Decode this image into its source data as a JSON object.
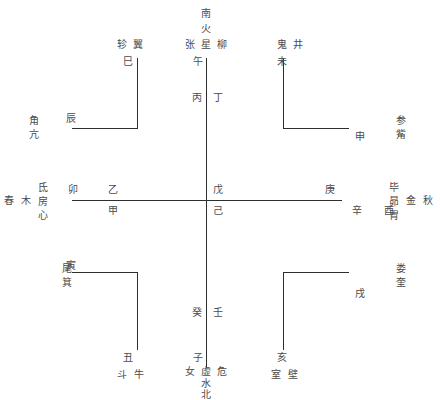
{
  "diagram": {
    "type": "cosmological-cross-chart",
    "line_color": "#2e2e2e",
    "text_color": "#4a4a4a",
    "background": "#ffffff",
    "directions": {
      "south": "南",
      "north": "北",
      "east_season": "春",
      "west_season": "秋"
    },
    "elements": {
      "fire": "火",
      "water": "水",
      "wood": "木",
      "metal": "金"
    },
    "center": {
      "upper_stem": "戊",
      "lower_stem": "己"
    },
    "top": {
      "direction": "南",
      "element": "火",
      "mansions": [
        "张",
        "星",
        "柳"
      ],
      "branch": "午",
      "stem_left": "丙",
      "stem_right": "丁"
    },
    "bottom": {
      "direction": "北",
      "element": "水",
      "mansions": [
        "女",
        "虚",
        "危"
      ],
      "branch": "子",
      "stem_left": "癸",
      "stem_right": "壬"
    },
    "left": {
      "season": "春",
      "element": "木",
      "mansions": [
        "氐",
        "房",
        "心"
      ],
      "branch": "卯",
      "stem_upper": "乙",
      "stem_lower": "甲"
    },
    "right": {
      "season": "秋",
      "element": "金",
      "mansions": [
        "毕",
        "昴",
        "胃"
      ],
      "branch": "酉",
      "stem_upper": "庚",
      "stem_lower": "辛"
    },
    "corners": {
      "top_left": {
        "mansions": [
          "轸",
          "翼"
        ],
        "branch_inner": "巳",
        "outer_mansions": [
          "角",
          "亢"
        ],
        "branch_outer": "辰"
      },
      "top_right": {
        "mansions": [
          "鬼",
          "井"
        ],
        "branch_inner": "未",
        "outer_mansions": [
          "参",
          "觜"
        ],
        "branch_outer": "申"
      },
      "bottom_left": {
        "mansions": [
          "尾",
          "箕"
        ],
        "branch_outer": "寅",
        "inner_mansions": [
          "斗",
          "牛"
        ],
        "branch_inner": "丑"
      },
      "bottom_right": {
        "mansions": [
          "娄",
          "奎"
        ],
        "branch_outer": "戌",
        "inner_mansions": [
          "室",
          "壁"
        ],
        "branch_inner": "亥"
      }
    }
  }
}
